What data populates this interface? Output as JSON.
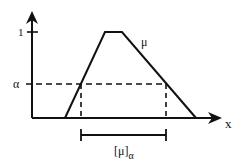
{
  "diagram": {
    "labels": {
      "y_tick_one": "1",
      "alpha": "α",
      "mu": "μ",
      "x_axis": "x",
      "interval": "[μ]",
      "interval_subscript": "α"
    },
    "colors": {
      "stroke": "#111111",
      "background": "#ffffff"
    }
  }
}
